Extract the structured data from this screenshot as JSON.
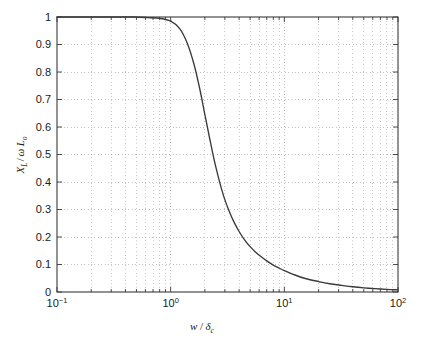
{
  "chart_data": {
    "type": "line",
    "title": "",
    "xlabel": "w / δc",
    "xlabel_parts": {
      "variable": "w",
      "slash": "/",
      "delta": "δ",
      "delta_sub": "c"
    },
    "ylabel": "XL / ω Lo",
    "ylabel_parts": {
      "x": "X",
      "x_sub": "L",
      "slash": "/",
      "omega": "ω",
      "l": "L",
      "l_sub": "o"
    },
    "xscale": "log",
    "yscale": "linear",
    "xlim": [
      0.1,
      100
    ],
    "ylim": [
      0,
      1
    ],
    "grid": true,
    "grid_style": "dotted",
    "legend": null,
    "line_color": "#3a3a3a",
    "frame_color": "#3a3a3a",
    "grid_color": "#b4b4b4",
    "xticks": [
      {
        "value": 0.1,
        "base": "10",
        "exp": "−1"
      },
      {
        "value": 1,
        "base": "10",
        "exp": "0"
      },
      {
        "value": 10,
        "base": "10",
        "exp": "1"
      },
      {
        "value": 100,
        "base": "10",
        "exp": "2"
      }
    ],
    "yticks": [
      "0",
      "0.1",
      "0.2",
      "0.3",
      "0.4",
      "0.5",
      "0.6",
      "0.7",
      "0.8",
      "0.9",
      "1"
    ],
    "ytick_values": [
      0,
      0.1,
      0.2,
      0.3,
      0.4,
      0.5,
      0.6,
      0.7,
      0.8,
      0.9,
      1
    ],
    "series": [
      {
        "name": "XL/wLo",
        "x": [
          0.1,
          0.13,
          0.17,
          0.22,
          0.28,
          0.37,
          0.48,
          0.62,
          0.8,
          1.0,
          1.2,
          1.4,
          1.6,
          1.8,
          2.0,
          2.2,
          2.4,
          2.6,
          2.8,
          3.0,
          3.3,
          3.6,
          4.0,
          4.5,
          5.0,
          5.6,
          6.3,
          7.0,
          8.0,
          9.0,
          10.0,
          12.0,
          15.0,
          20.0,
          25.0,
          32.0,
          40.0,
          50.0,
          63.0,
          80.0,
          100.0
        ],
        "y": [
          1.0,
          1.0,
          1.0,
          1.0,
          1.0,
          1.0,
          1.0,
          0.998,
          0.995,
          0.985,
          0.958,
          0.905,
          0.83,
          0.74,
          0.645,
          0.56,
          0.485,
          0.425,
          0.375,
          0.335,
          0.29,
          0.255,
          0.22,
          0.188,
          0.165,
          0.145,
          0.127,
          0.113,
          0.098,
          0.087,
          0.078,
          0.064,
          0.05,
          0.038,
          0.03,
          0.024,
          0.019,
          0.015,
          0.012,
          0.0095,
          0.008
        ]
      }
    ]
  },
  "figure": {
    "background_color": "#ffffff",
    "plot_area": {
      "left": 57,
      "top": 17,
      "right": 398,
      "bottom": 292
    }
  }
}
